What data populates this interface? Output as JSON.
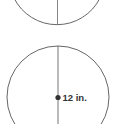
{
  "diagram": {
    "top_circle": {
      "partial": true,
      "visible_part": "bottom arc with vertical diameter line"
    },
    "bottom_circle": {
      "center_marker": "dot",
      "measurement_label": "12 in.",
      "line": "vertical diameter through center"
    },
    "colors": {
      "stroke": "#555555",
      "dot": "#333333",
      "text": "#333333"
    }
  }
}
